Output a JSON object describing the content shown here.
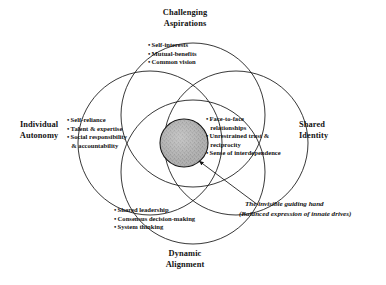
{
  "diagram": {
    "type": "four-circle-venn",
    "title_visible": false,
    "outer_labels": [
      {
        "id": "challenging-aspirations",
        "text": "Challenging\nAspirations",
        "position": "top"
      },
      {
        "id": "individual-autonomy",
        "text": "Individual\nAutonomy",
        "position": "left"
      },
      {
        "id": "shared-identity",
        "text": "Shared\nIdentity",
        "position": "right"
      },
      {
        "id": "dynamic-alignment",
        "text": "Dynamic\nAlignment",
        "position": "bottom"
      }
    ],
    "circles": [
      {
        "id": "challenging-aspirations",
        "label": "Challenging Aspirations",
        "bullets": [
          {
            "text": "Self-interests",
            "continuation": false
          },
          {
            "text": "Mutual-benefits",
            "continuation": false
          },
          {
            "text": "Common vision",
            "continuation": false
          }
        ]
      },
      {
        "id": "individual-autonomy",
        "label": "Individual Autonomy",
        "bullets": [
          {
            "text": "Self-reliance",
            "continuation": false
          },
          {
            "text": "Talent & expertise",
            "continuation": false
          },
          {
            "text": "Social responsibility",
            "continuation": false
          },
          {
            "text": "& accountability",
            "continuation": true
          }
        ]
      },
      {
        "id": "shared-identity",
        "label": "Shared Identity",
        "bullets": [
          {
            "text": "Face-to-face",
            "continuation": false
          },
          {
            "text": "relationships",
            "continuation": true
          },
          {
            "text": "Unrestrained trust &",
            "continuation": false
          },
          {
            "text": "reciprocity",
            "continuation": true
          },
          {
            "text": "Sense of interdependence",
            "continuation": false
          }
        ]
      },
      {
        "id": "dynamic-alignment",
        "label": "Dynamic Alignment",
        "bullets": [
          {
            "text": "Shared leadership",
            "continuation": false
          },
          {
            "text": "Consensus decision-making",
            "continuation": false
          },
          {
            "text": "System thinking",
            "continuation": false
          }
        ]
      }
    ],
    "center": {
      "id": "invisible-guiding-hand",
      "fill_style": "gray-speckled-texture",
      "fill_color": "#a9a9a9",
      "stroke_color": "#111111"
    },
    "annotation": {
      "id": "invisible-hand-callout",
      "line1": "The invisible guiding hand",
      "line2": "(Balanced expression of innate drives)",
      "style": "bold-italic",
      "leader_line": true
    },
    "colors": {
      "stroke": "#141414",
      "text": "#141414",
      "background": "#ffffff",
      "center_fill": "#a9a9a9"
    },
    "bullet_glyph": "•"
  }
}
